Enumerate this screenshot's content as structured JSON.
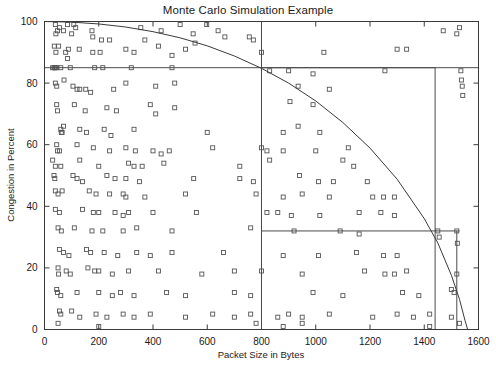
{
  "chart_data": {
    "type": "scatter",
    "title": "Monte Carlo Simulation Example",
    "xlabel": "Packet Size in Bytes",
    "ylabel": "Congestion in Percent",
    "xlim": [
      0,
      1600
    ],
    "ylim": [
      0,
      100
    ],
    "xticks": [
      0,
      200,
      400,
      600,
      800,
      1000,
      1200,
      1400,
      1600
    ],
    "yticks": [
      0,
      20,
      40,
      60,
      80,
      100
    ],
    "xtick_labels": [
      "0",
      "200",
      "400",
      "600",
      "800",
      "1000",
      "1200",
      "1400",
      "1600"
    ],
    "ytick_labels": [
      "0",
      "20",
      "40",
      "60",
      "80",
      "100"
    ],
    "grid": false,
    "legend": "none",
    "marker": "open-square",
    "marker_color": "#555555",
    "line_color": "#3a3a3a",
    "annotations": [
      {
        "name": "horizontal-threshold-line",
        "type": "hline",
        "y": 85,
        "x_from": 0,
        "x_to": 1600
      },
      {
        "name": "vertical-threshold-line",
        "type": "vline",
        "x": 800,
        "y_from": 0,
        "y_to": 100
      },
      {
        "name": "region-rectangle",
        "type": "rect",
        "x_from": 800,
        "x_to": 1440,
        "y_from": 32,
        "y_to": 85
      },
      {
        "name": "vertical-marker-line",
        "type": "vline",
        "x": 1440,
        "y_from": 0,
        "y_to": 32
      },
      {
        "name": "vertical-edge-line",
        "type": "vline",
        "x": 1520,
        "y_from": 0,
        "y_to": 32
      },
      {
        "name": "horizontal-marker-line",
        "type": "hline",
        "y": 32,
        "x_from": 1440,
        "x_to": 1530
      }
    ],
    "curve": {
      "name": "quarter-ellipse-boundary",
      "description": "Decreasing arc from (0,100) to (1560,0)",
      "points": [
        [
          0,
          100
        ],
        [
          100,
          99.8
        ],
        [
          200,
          99.2
        ],
        [
          300,
          98.2
        ],
        [
          400,
          96.7
        ],
        [
          500,
          94.7
        ],
        [
          600,
          92.1
        ],
        [
          700,
          88.8
        ],
        [
          800,
          84.8
        ],
        [
          900,
          80.0
        ],
        [
          1000,
          74.2
        ],
        [
          1100,
          67.2
        ],
        [
          1200,
          58.9
        ],
        [
          1300,
          48.8
        ],
        [
          1400,
          36.0
        ],
        [
          1450,
          28.1
        ],
        [
          1500,
          17.6
        ],
        [
          1530,
          9.8
        ],
        [
          1550,
          3.0
        ],
        [
          1560,
          0
        ]
      ]
    },
    "points": [
      [
        40,
        99
      ],
      [
        42,
        96
      ],
      [
        48,
        97
      ],
      [
        55,
        98
      ],
      [
        70,
        97
      ],
      [
        85,
        99
      ],
      [
        100,
        96
      ],
      [
        108,
        99
      ],
      [
        115,
        98
      ],
      [
        175,
        97
      ],
      [
        178,
        95
      ],
      [
        210,
        94
      ],
      [
        240,
        94
      ],
      [
        355,
        98
      ],
      [
        370,
        94
      ],
      [
        430,
        97
      ],
      [
        500,
        99
      ],
      [
        548,
        96
      ],
      [
        555,
        93
      ],
      [
        598,
        99
      ],
      [
        640,
        97
      ],
      [
        665,
        95
      ],
      [
        755,
        95
      ],
      [
        770,
        94
      ],
      [
        1470,
        97
      ],
      [
        1520,
        96
      ],
      [
        1530,
        98
      ],
      [
        36,
        92
      ],
      [
        42,
        90
      ],
      [
        52,
        92
      ],
      [
        78,
        90
      ],
      [
        85,
        88
      ],
      [
        88,
        91
      ],
      [
        128,
        91
      ],
      [
        178,
        90
      ],
      [
        205,
        90
      ],
      [
        300,
        91
      ],
      [
        330,
        90
      ],
      [
        420,
        92
      ],
      [
        470,
        89
      ],
      [
        520,
        91
      ],
      [
        800,
        90
      ],
      [
        1030,
        90
      ],
      [
        1300,
        91
      ],
      [
        1335,
        91
      ],
      [
        30,
        85
      ],
      [
        35,
        85
      ],
      [
        38,
        85
      ],
      [
        40,
        85
      ],
      [
        45,
        85
      ],
      [
        60,
        85
      ],
      [
        95,
        85
      ],
      [
        185,
        85
      ],
      [
        215,
        85
      ],
      [
        320,
        85
      ],
      [
        470,
        85
      ],
      [
        830,
        84
      ],
      [
        900,
        84
      ],
      [
        990,
        83
      ],
      [
        1255,
        84
      ],
      [
        1535,
        84
      ],
      [
        1537,
        81
      ],
      [
        1540,
        79
      ],
      [
        1542,
        76
      ],
      [
        40,
        80
      ],
      [
        45,
        79
      ],
      [
        72,
        81
      ],
      [
        105,
        79
      ],
      [
        120,
        78
      ],
      [
        130,
        78
      ],
      [
        152,
        78
      ],
      [
        170,
        77
      ],
      [
        255,
        78
      ],
      [
        300,
        80
      ],
      [
        410,
        79
      ],
      [
        480,
        80
      ],
      [
        935,
        79
      ],
      [
        1050,
        78
      ],
      [
        45,
        73
      ],
      [
        48,
        71
      ],
      [
        110,
        73
      ],
      [
        150,
        71
      ],
      [
        230,
        72
      ],
      [
        265,
        71
      ],
      [
        390,
        73
      ],
      [
        410,
        70
      ],
      [
        480,
        72
      ],
      [
        905,
        74
      ],
      [
        990,
        73
      ],
      [
        60,
        65
      ],
      [
        62,
        64
      ],
      [
        65,
        64
      ],
      [
        70,
        66
      ],
      [
        130,
        65
      ],
      [
        155,
        64
      ],
      [
        220,
        65
      ],
      [
        245,
        63
      ],
      [
        330,
        65
      ],
      [
        600,
        64
      ],
      [
        880,
        64
      ],
      [
        935,
        66
      ],
      [
        1015,
        64
      ],
      [
        45,
        60
      ],
      [
        48,
        58
      ],
      [
        55,
        58
      ],
      [
        120,
        60
      ],
      [
        180,
        59
      ],
      [
        240,
        58
      ],
      [
        300,
        59
      ],
      [
        335,
        58
      ],
      [
        400,
        58
      ],
      [
        430,
        57
      ],
      [
        460,
        58
      ],
      [
        620,
        59
      ],
      [
        800,
        59
      ],
      [
        820,
        58
      ],
      [
        880,
        58
      ],
      [
        1000,
        58
      ],
      [
        1120,
        59
      ],
      [
        30,
        55
      ],
      [
        40,
        53
      ],
      [
        60,
        53
      ],
      [
        130,
        55
      ],
      [
        200,
        53
      ],
      [
        310,
        54
      ],
      [
        330,
        53
      ],
      [
        360,
        53
      ],
      [
        440,
        54
      ],
      [
        720,
        53
      ],
      [
        830,
        55
      ],
      [
        1100,
        55
      ],
      [
        1140,
        53
      ],
      [
        35,
        50
      ],
      [
        38,
        49
      ],
      [
        105,
        50
      ],
      [
        120,
        49
      ],
      [
        140,
        48
      ],
      [
        230,
        50
      ],
      [
        260,
        49
      ],
      [
        300,
        49
      ],
      [
        350,
        48
      ],
      [
        550,
        49
      ],
      [
        720,
        49
      ],
      [
        770,
        48
      ],
      [
        940,
        50
      ],
      [
        1010,
        48
      ],
      [
        1065,
        48
      ],
      [
        1190,
        48
      ],
      [
        40,
        45
      ],
      [
        50,
        44
      ],
      [
        65,
        45
      ],
      [
        165,
        45
      ],
      [
        190,
        44
      ],
      [
        240,
        44
      ],
      [
        290,
        44
      ],
      [
        300,
        43
      ],
      [
        370,
        43
      ],
      [
        520,
        44
      ],
      [
        780,
        44
      ],
      [
        880,
        43
      ],
      [
        950,
        44
      ],
      [
        1050,
        43
      ],
      [
        1210,
        43
      ],
      [
        1250,
        43
      ],
      [
        1290,
        43
      ],
      [
        40,
        39
      ],
      [
        55,
        38
      ],
      [
        140,
        39
      ],
      [
        180,
        38
      ],
      [
        200,
        38
      ],
      [
        260,
        38
      ],
      [
        290,
        37
      ],
      [
        310,
        38
      ],
      [
        400,
        38
      ],
      [
        560,
        38
      ],
      [
        820,
        38
      ],
      [
        860,
        38
      ],
      [
        910,
        37
      ],
      [
        1015,
        37
      ],
      [
        1160,
        38
      ],
      [
        1240,
        38
      ],
      [
        1290,
        37
      ],
      [
        50,
        33
      ],
      [
        62,
        32
      ],
      [
        110,
        33
      ],
      [
        175,
        32
      ],
      [
        215,
        32
      ],
      [
        290,
        32
      ],
      [
        340,
        33
      ],
      [
        470,
        32
      ],
      [
        760,
        33
      ],
      [
        920,
        32
      ],
      [
        1090,
        32
      ],
      [
        1160,
        31
      ],
      [
        1450,
        32
      ],
      [
        1455,
        30
      ],
      [
        1520,
        32
      ],
      [
        1522,
        28
      ],
      [
        55,
        26
      ],
      [
        70,
        25
      ],
      [
        90,
        24
      ],
      [
        155,
        26
      ],
      [
        170,
        25
      ],
      [
        220,
        25
      ],
      [
        270,
        24
      ],
      [
        340,
        25
      ],
      [
        390,
        24
      ],
      [
        470,
        25
      ],
      [
        660,
        25
      ],
      [
        880,
        24
      ],
      [
        1010,
        24
      ],
      [
        1150,
        25
      ],
      [
        1250,
        24
      ],
      [
        1300,
        24
      ],
      [
        50,
        20
      ],
      [
        52,
        18
      ],
      [
        80,
        19
      ],
      [
        95,
        18
      ],
      [
        160,
        20
      ],
      [
        185,
        19
      ],
      [
        200,
        19
      ],
      [
        250,
        18
      ],
      [
        310,
        19
      ],
      [
        420,
        19
      ],
      [
        580,
        18
      ],
      [
        700,
        19
      ],
      [
        800,
        19
      ],
      [
        950,
        18
      ],
      [
        1180,
        19
      ],
      [
        1255,
        18
      ],
      [
        1290,
        18
      ],
      [
        1335,
        19
      ],
      [
        1520,
        18
      ],
      [
        45,
        13
      ],
      [
        48,
        12
      ],
      [
        60,
        11
      ],
      [
        120,
        12
      ],
      [
        200,
        12
      ],
      [
        250,
        11
      ],
      [
        280,
        12
      ],
      [
        330,
        11
      ],
      [
        450,
        12
      ],
      [
        520,
        11
      ],
      [
        700,
        12
      ],
      [
        760,
        11
      ],
      [
        990,
        12
      ],
      [
        1100,
        11
      ],
      [
        1320,
        12
      ],
      [
        1380,
        11
      ],
      [
        1500,
        13
      ],
      [
        1510,
        12
      ],
      [
        55,
        6
      ],
      [
        60,
        5
      ],
      [
        100,
        6
      ],
      [
        130,
        4
      ],
      [
        190,
        5
      ],
      [
        230,
        4
      ],
      [
        290,
        5
      ],
      [
        330,
        4
      ],
      [
        390,
        5
      ],
      [
        520,
        4
      ],
      [
        620,
        5
      ],
      [
        700,
        4
      ],
      [
        760,
        5
      ],
      [
        860,
        4
      ],
      [
        900,
        5
      ],
      [
        950,
        4
      ],
      [
        1050,
        5
      ],
      [
        1210,
        4
      ],
      [
        1300,
        5
      ],
      [
        1360,
        4
      ],
      [
        1420,
        5
      ],
      [
        1500,
        4
      ],
      [
        50,
        2
      ],
      [
        200,
        1
      ],
      [
        780,
        2
      ],
      [
        880,
        1
      ],
      [
        950,
        2
      ],
      [
        1420,
        1
      ],
      [
        1530,
        2
      ]
    ]
  }
}
